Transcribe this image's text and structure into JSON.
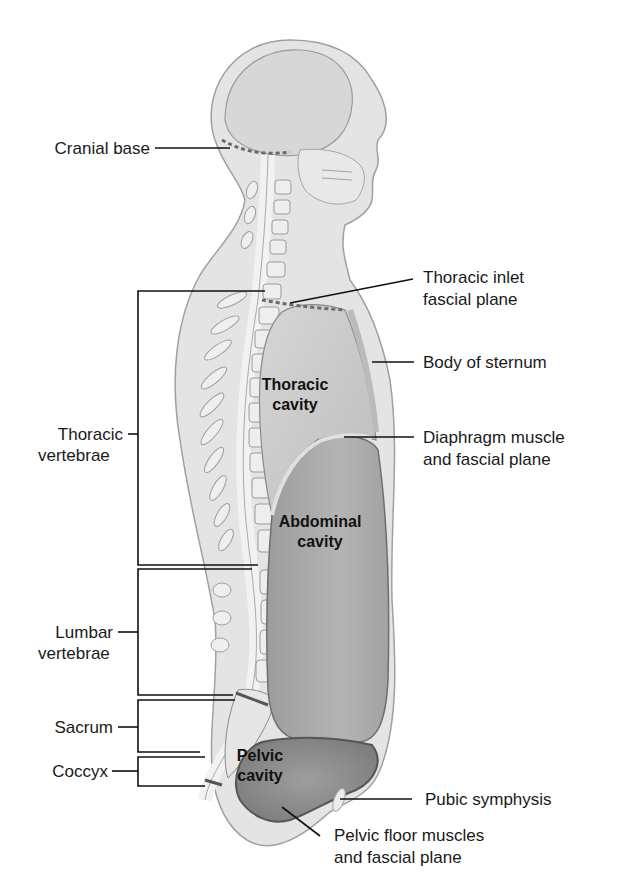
{
  "figure": {
    "labels_left": {
      "cranial_base": "Cranial base",
      "thoracic_vertebrae_1": "Thoracic",
      "thoracic_vertebrae_2": "vertebrae",
      "lumbar_vertebrae_1": "Lumbar",
      "lumbar_vertebrae_2": "vertebrae",
      "sacrum": "Sacrum",
      "coccyx": "Coccyx"
    },
    "labels_right": {
      "thoracic_inlet_1": "Thoracic inlet",
      "thoracic_inlet_2": "fascial plane",
      "body_of_sternum": "Body of sternum",
      "diaphragm_1": "Diaphragm muscle",
      "diaphragm_2": "and fascial plane",
      "pubic_symphysis": "Pubic symphysis",
      "pelvic_floor_1": "Pelvic floor muscles",
      "pelvic_floor_2": "and fascial plane"
    },
    "cavities": {
      "thoracic_1": "Thoracic",
      "thoracic_2": "cavity",
      "abdominal_1": "Abdominal",
      "abdominal_2": "cavity",
      "pelvic_1": "Pelvic",
      "pelvic_2": "cavity"
    },
    "colors": {
      "body": "#e3e3e3",
      "outline": "#9a9a9a",
      "thoracic_cavity": "#c9c9c9",
      "abdominal_cavity": "#a9a9a9",
      "pelvic_cavity": "#8f8f8f",
      "leader_line": "#111111"
    }
  }
}
